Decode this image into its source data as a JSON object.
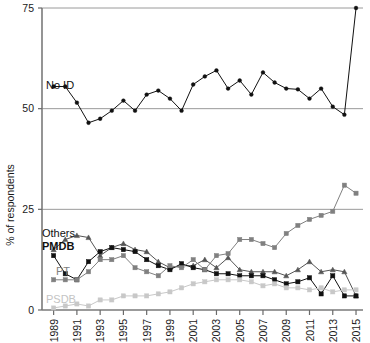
{
  "chart_data": {
    "type": "line",
    "title": "",
    "xlabel": "",
    "ylabel": "% of respondents",
    "xlim": [
      1988,
      2015.6
    ],
    "ylim": [
      0,
      75
    ],
    "yticks": [
      0,
      25,
      50,
      75
    ],
    "ytick_labels": [
      "0",
      "25",
      "50",
      "75"
    ],
    "xticks": [
      1989,
      1991,
      1993,
      1995,
      1997,
      1999,
      2001,
      2003,
      2005,
      2007,
      2009,
      2011,
      2013,
      2015
    ],
    "xtick_labels": [
      "1989",
      "1991",
      "1993",
      "1995",
      "1997",
      "1999",
      "2001",
      "2003",
      "2005",
      "2007",
      "2009",
      "2011",
      "2013",
      "2015"
    ],
    "grid": "horizontal-at-25-50-75",
    "legend_position": "inline-labels",
    "x": [
      1989,
      1990,
      1991,
      1992,
      1993,
      1994,
      1995,
      1996,
      1997,
      1998,
      1999,
      2000,
      2001,
      2002,
      2003,
      2004,
      2005,
      2006,
      2007,
      2008,
      2009,
      2010,
      2011,
      2012,
      2013,
      2014,
      2015
    ],
    "series": [
      {
        "name": "No ID",
        "color": "#111111",
        "marker": "circle",
        "label_x": 1989,
        "values": [
          55.5,
          55.5,
          51.5,
          46.5,
          47.5,
          49.5,
          52.0,
          49.5,
          53.5,
          54.5,
          52.5,
          49.5,
          56.0,
          58.0,
          59.5,
          55.0,
          57.0,
          53.5,
          59.0,
          56.5,
          55.0,
          54.8,
          52.5,
          55.0,
          50.5,
          48.5,
          75.0
        ]
      },
      {
        "name": "Others",
        "color": "#555555",
        "marker": "triangle",
        "label_x": 1989,
        "values": [
          15.0,
          17.5,
          18.5,
          18.0,
          13.5,
          15.5,
          16.5,
          15.0,
          14.5,
          12.0,
          10.5,
          11.0,
          11.0,
          12.5,
          10.5,
          13.0,
          10.0,
          9.5,
          9.5,
          9.5,
          8.5,
          10.0,
          12.0,
          9.5,
          10.0,
          9.5,
          3.5
        ]
      },
      {
        "name": "PMDB",
        "color": "#111111",
        "marker": "square",
        "label_x": 1989,
        "values": [
          13.5,
          9.0,
          7.5,
          12.0,
          14.5,
          15.5,
          15.0,
          14.5,
          12.5,
          11.0,
          10.0,
          11.5,
          10.5,
          10.0,
          9.0,
          9.0,
          8.5,
          8.5,
          8.5,
          7.5,
          6.5,
          7.0,
          8.0,
          4.0,
          8.5,
          3.5,
          3.5
        ]
      },
      {
        "name": "PT",
        "color": "#808080",
        "marker": "square",
        "label_x": 1989,
        "values": [
          7.5,
          7.5,
          7.5,
          9.5,
          12.5,
          12.5,
          13.5,
          10.5,
          9.5,
          8.5,
          11.0,
          10.5,
          12.5,
          10.0,
          13.5,
          14.0,
          17.5,
          17.5,
          16.5,
          15.5,
          19.0,
          21.0,
          22.5,
          23.5,
          24.5,
          31.0,
          29.0
        ]
      },
      {
        "name": "PSDB",
        "color": "#c8c8c8",
        "marker": "square",
        "label_x": 1989,
        "values": [
          0.5,
          1.0,
          1.5,
          1.0,
          2.5,
          2.5,
          3.5,
          3.5,
          3.5,
          4.0,
          4.5,
          5.5,
          6.5,
          7.0,
          7.5,
          7.5,
          7.5,
          7.0,
          6.0,
          6.5,
          5.5,
          5.5,
          5.0,
          5.5,
          4.5,
          5.0,
          5.0
        ]
      }
    ]
  },
  "axes": {
    "ylabel": "% of respondents"
  }
}
